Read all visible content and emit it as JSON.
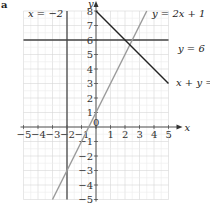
{
  "figure_letter": "a",
  "chart_data": {
    "type": "line",
    "title": "",
    "xlabel": "x",
    "ylabel": "y",
    "xlim": [
      -5,
      5
    ],
    "ylim": [
      -5,
      8
    ],
    "grid": true,
    "x_ticks": [
      "-5",
      "-4",
      "-3",
      "-2",
      "-1",
      "0",
      "1",
      "2",
      "3",
      "4",
      "5"
    ],
    "y_ticks": [
      "-5",
      "-4",
      "-3",
      "-2",
      "-1",
      "1",
      "2",
      "3",
      "4",
      "5",
      "6",
      "7",
      "8"
    ],
    "series": [
      {
        "name": "x = -2",
        "label": "x = −2",
        "kind": "vertical",
        "x": -2,
        "color": "#555555"
      },
      {
        "name": "y = 6",
        "label": "y = 6",
        "kind": "horizontal",
        "y": 6,
        "color": "#444444"
      },
      {
        "name": "y = 2x + 1",
        "label": "y = 2x + 1",
        "kind": "line",
        "points": [
          [
            -3,
            -5
          ],
          [
            3.5,
            8
          ]
        ],
        "color": "#999999"
      },
      {
        "name": "x + y = 8",
        "label": "x + y = 8",
        "kind": "line",
        "points": [
          [
            0,
            8
          ],
          [
            5,
            3
          ]
        ],
        "color": "#222222"
      }
    ]
  }
}
